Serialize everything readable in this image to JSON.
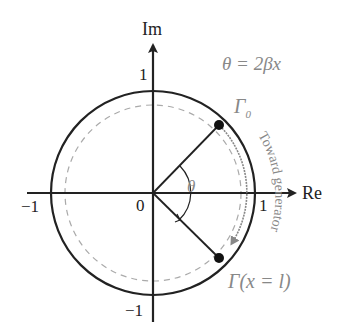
{
  "diagram": {
    "axes": {
      "x_label": "Re",
      "y_label": "Im",
      "origin": "0",
      "x_ticks": [
        "−1",
        "1"
      ],
      "y_ticks": [
        "1",
        "−1"
      ]
    },
    "formula": "θ = 2βx",
    "angle_label": "θ",
    "point_start": {
      "label": "Γ",
      "subscript": "0"
    },
    "point_end": {
      "label": "Γ(x = l)"
    },
    "arc_label": "Toward generator",
    "colors": {
      "axis": "#222222",
      "circle": "#222222",
      "dashed": "#999999",
      "text_grey": "#888888"
    }
  }
}
